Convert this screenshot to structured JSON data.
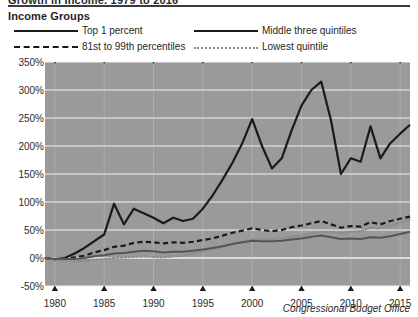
{
  "header": {
    "clipped_title": "Growth in Income, 1979 to 2016",
    "legend_heading": "Income Groups",
    "source": "Congressional Budget Office"
  },
  "legend": {
    "items": [
      {
        "label": "Top 1 percent",
        "style": "solid",
        "color": "#1a1a1a"
      },
      {
        "label": "Middle three quintiles",
        "style": "solid",
        "color": "#1a1a1a"
      },
      {
        "label": "81st to 99th percentiles",
        "style": "dashed",
        "color": "#1a1a1a"
      },
      {
        "label": "Lowest quintile",
        "style": "dotted",
        "color": "#8d8d8d"
      }
    ]
  },
  "axes": {
    "y_ticks": [
      "350%",
      "300%",
      "250%",
      "200%",
      "150%",
      "100%",
      "50%",
      "0%",
      "-50%"
    ],
    "x_ticks": [
      "1980",
      "1985",
      "1990",
      "1995",
      "2000",
      "2005",
      "2010",
      "2015"
    ]
  },
  "colors": {
    "plot_background": "#9a9a9a",
    "gridline": "#f2f2f2",
    "line_dark": "#1a1a1a",
    "line_grey": "#8d8d8d",
    "page_background": "#ffffff"
  },
  "chart_data": {
    "type": "line",
    "title": "Growth in Income, 1979 to 2016",
    "xlabel": "",
    "ylabel": "",
    "xlim": [
      1979,
      2016
    ],
    "ylim": [
      -50,
      350
    ],
    "ytick_step": 50,
    "grid": true,
    "legend_position": "above-plot",
    "x": [
      1979,
      1980,
      1981,
      1982,
      1983,
      1984,
      1985,
      1986,
      1987,
      1988,
      1989,
      1990,
      1991,
      1992,
      1993,
      1994,
      1995,
      1996,
      1997,
      1998,
      1999,
      2000,
      2001,
      2002,
      2003,
      2004,
      2005,
      2006,
      2007,
      2008,
      2009,
      2010,
      2011,
      2012,
      2013,
      2014,
      2015,
      2016
    ],
    "series": [
      {
        "name": "Top 1 percent",
        "style": "solid",
        "color": "#1a1a1a",
        "width": 2.2,
        "values": [
          0,
          -2,
          0,
          8,
          18,
          30,
          42,
          97,
          60,
          88,
          80,
          72,
          62,
          72,
          66,
          70,
          88,
          112,
          140,
          170,
          205,
          248,
          200,
          160,
          178,
          228,
          272,
          300,
          315,
          245,
          150,
          178,
          172,
          235,
          178,
          205,
          222,
          238
        ]
      },
      {
        "name": "81st to 99th percentiles",
        "style": "dashed",
        "color": "#1a1a1a",
        "width": 2.2,
        "values": [
          0,
          -2,
          -1,
          1,
          4,
          10,
          14,
          20,
          22,
          27,
          29,
          28,
          26,
          28,
          27,
          29,
          32,
          35,
          40,
          45,
          49,
          53,
          50,
          48,
          50,
          55,
          58,
          62,
          66,
          60,
          54,
          57,
          56,
          64,
          60,
          66,
          70,
          74
        ]
      },
      {
        "name": "Lowest quintile",
        "style": "dotted",
        "color": "#8d8d8d",
        "width": 2.0,
        "values": [
          0,
          -3,
          -5,
          -6,
          -5,
          -3,
          -2,
          0,
          1,
          2,
          3,
          2,
          1,
          3,
          4,
          8,
          12,
          16,
          20,
          25,
          29,
          33,
          34,
          34,
          35,
          38,
          40,
          44,
          47,
          46,
          44,
          47,
          48,
          54,
          53,
          58,
          63,
          69
        ]
      },
      {
        "name": "Middle three quintiles",
        "style": "solid",
        "color": "#555555",
        "width": 2.0,
        "values": [
          0,
          -2,
          -2,
          -2,
          0,
          3,
          5,
          8,
          9,
          11,
          13,
          12,
          10,
          11,
          11,
          13,
          15,
          18,
          21,
          25,
          28,
          31,
          30,
          30,
          31,
          33,
          35,
          38,
          40,
          37,
          34,
          35,
          34,
          37,
          36,
          39,
          43,
          47
        ]
      }
    ]
  }
}
